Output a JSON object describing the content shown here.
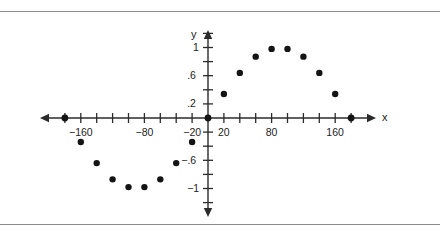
{
  "figure": {
    "name": "sine-scatter-plot",
    "background_color": "#ffffff",
    "rule_color": "#8b8b8b",
    "point_color": "#141414",
    "axis_color": "#2b2b2b",
    "axis_labels": {
      "x": "x",
      "y": "y"
    },
    "x_tick_labels": [
      {
        "value": -160,
        "text": "−160"
      },
      {
        "value": -80,
        "text": "−80"
      },
      {
        "value": -20,
        "text": "−20"
      },
      {
        "value": 20,
        "text": "20"
      },
      {
        "value": 80,
        "text": "80"
      },
      {
        "value": 160,
        "text": "160"
      }
    ],
    "y_tick_labels": [
      {
        "value": 1,
        "text": "1"
      },
      {
        "value": 0.6,
        "text": ".6"
      },
      {
        "value": 0.2,
        "text": ".2"
      },
      {
        "value": -0.6,
        "text": "−.6"
      },
      {
        "value": -1,
        "text": "−1"
      }
    ]
  },
  "chart_data": {
    "type": "scatter",
    "title": "",
    "subtitle": "",
    "xlabel": "x",
    "ylabel": "y",
    "xlim": [
      -200,
      200
    ],
    "ylim": [
      -1.25,
      1.25
    ],
    "x_tick_step": 20,
    "y_tick_step": 0.2,
    "grid": false,
    "legend": null,
    "legend_position": "none",
    "x_ticks": [
      -180,
      -160,
      -140,
      -120,
      -100,
      -80,
      -60,
      -40,
      -20,
      0,
      20,
      40,
      60,
      80,
      100,
      120,
      140,
      160,
      180
    ],
    "y_ticks": [
      -1.2,
      -1,
      -0.8,
      -0.6,
      -0.4,
      -0.2,
      0,
      0.2,
      0.4,
      0.6,
      0.8,
      1,
      1.2
    ],
    "x_labeled_ticks": [
      -160,
      -80,
      -20,
      20,
      80,
      160
    ],
    "y_labeled_ticks": [
      1,
      0.6,
      0.2,
      -0.6,
      -1
    ],
    "x": [
      -180,
      -160,
      -140,
      -120,
      -100,
      -80,
      -60,
      -40,
      -20,
      0,
      20,
      40,
      60,
      80,
      100,
      120,
      140,
      160,
      180
    ],
    "y": [
      0,
      -0.34,
      -0.64,
      -0.87,
      -0.98,
      -0.98,
      -0.87,
      -0.64,
      -0.34,
      0,
      0.34,
      0.64,
      0.87,
      0.98,
      0.98,
      0.87,
      0.64,
      0.34,
      0
    ],
    "points": [
      {
        "x": -180,
        "y": 0,
        "on_axis": true
      },
      {
        "x": -160,
        "y": -0.34,
        "on_axis": false
      },
      {
        "x": -140,
        "y": -0.64,
        "on_axis": false
      },
      {
        "x": -120,
        "y": -0.87,
        "on_axis": false
      },
      {
        "x": -100,
        "y": -0.98,
        "on_axis": false
      },
      {
        "x": -80,
        "y": -0.98,
        "on_axis": false
      },
      {
        "x": -60,
        "y": -0.87,
        "on_axis": false
      },
      {
        "x": -40,
        "y": -0.64,
        "on_axis": false
      },
      {
        "x": -20,
        "y": -0.34,
        "on_axis": false
      },
      {
        "x": 0,
        "y": 0,
        "on_axis": true
      },
      {
        "x": 20,
        "y": 0.34,
        "on_axis": false
      },
      {
        "x": 40,
        "y": 0.64,
        "on_axis": false
      },
      {
        "x": 60,
        "y": 0.87,
        "on_axis": false
      },
      {
        "x": 80,
        "y": 0.98,
        "on_axis": false
      },
      {
        "x": 100,
        "y": 0.98,
        "on_axis": false
      },
      {
        "x": 120,
        "y": 0.87,
        "on_axis": false
      },
      {
        "x": 140,
        "y": 0.64,
        "on_axis": false
      },
      {
        "x": 160,
        "y": 0.34,
        "on_axis": false
      },
      {
        "x": 180,
        "y": 0,
        "on_axis": true
      }
    ],
    "annotations": []
  }
}
